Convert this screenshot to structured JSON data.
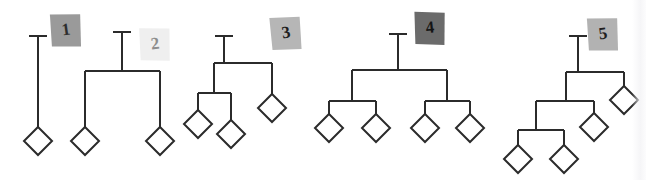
{
  "figure": {
    "background_color": "#ffffff",
    "line_color": "#2b2b2b",
    "leaf_fill": "#ffffff",
    "leaf_stroke": "#2b2b2b",
    "leaf_shape": "diamond",
    "width": 646,
    "height": 180
  },
  "badges": [
    {
      "label": "1",
      "fill": "#9a9a9a",
      "text_color": "#2e2e2e",
      "x": 66,
      "y": 30,
      "rotation": -8,
      "opacity": 1
    },
    {
      "label": "2",
      "fill": "#efefef",
      "text_color": "#8d8d8d",
      "x": 155,
      "y": 44,
      "rotation": -7,
      "opacity": 1
    },
    {
      "label": "3",
      "fill": "#b6b6b6",
      "text_color": "#1f1f1f",
      "x": 286,
      "y": 33,
      "rotation": -10,
      "opacity": 1
    },
    {
      "label": "4",
      "fill": "#6b6b6b",
      "text_color": "#141414",
      "x": 430,
      "y": 28,
      "rotation": -6,
      "opacity": 1
    },
    {
      "label": "5",
      "fill": "#b2b2b2",
      "text_color": "#1f1f1f",
      "x": 603,
      "y": 34,
      "rotation": -8,
      "opacity": 1
    }
  ],
  "trees": [
    {
      "id": "tree-1",
      "label": "1",
      "leaf_count": 1,
      "internal_node_count": 0,
      "max_depth": 1,
      "description": "Single unbranched stem ending in one tip",
      "stem": {
        "x": 38,
        "y_top": 36,
        "y_bottom": 127
      },
      "stem_cap": {
        "x1": 29,
        "x2": 47,
        "y": 36
      },
      "leaves": [
        {
          "cx": 38,
          "cy": 141
        }
      ],
      "connectors": []
    },
    {
      "id": "tree-2",
      "label": "2",
      "leaf_count": 2,
      "internal_node_count": 1,
      "max_depth": 2,
      "description": "Root splits into two tips",
      "stem": {
        "x": 122,
        "y_top": 32,
        "y_bottom": 71
      },
      "stem_cap": {
        "x1": 113,
        "x2": 131,
        "y": 32
      },
      "leaves": [
        {
          "cx": 85,
          "cy": 141
        },
        {
          "cx": 160,
          "cy": 141
        }
      ],
      "connectors": [
        {
          "type": "hbar",
          "x1": 85,
          "x2": 160,
          "y": 71
        },
        {
          "type": "vline",
          "x": 85,
          "y1": 71,
          "y2": 127
        },
        {
          "type": "vline",
          "x": 160,
          "y1": 71,
          "y2": 127
        }
      ]
    },
    {
      "id": "tree-3",
      "label": "3",
      "leaf_count": 3,
      "internal_node_count": 2,
      "max_depth": 3,
      "description": "Root splits into a two-tip clade on the left and a single tip on the right",
      "stem": {
        "x": 224,
        "y_top": 36,
        "y_bottom": 63
      },
      "stem_cap": {
        "x1": 215,
        "x2": 233,
        "y": 36
      },
      "leaves": [
        {
          "cx": 198,
          "cy": 124
        },
        {
          "cx": 231,
          "cy": 134
        },
        {
          "cx": 272,
          "cy": 108
        }
      ],
      "connectors": [
        {
          "type": "hbar",
          "x1": 214,
          "x2": 272,
          "y": 63
        },
        {
          "type": "vline",
          "x": 214,
          "y1": 63,
          "y2": 93
        },
        {
          "type": "vline",
          "x": 272,
          "y1": 63,
          "y2": 94
        },
        {
          "type": "hbar",
          "x1": 198,
          "x2": 231,
          "y": 93
        },
        {
          "type": "vline",
          "x": 198,
          "y1": 93,
          "y2": 110
        },
        {
          "type": "vline",
          "x": 231,
          "y1": 93,
          "y2": 120
        }
      ]
    },
    {
      "id": "tree-4",
      "label": "4",
      "leaf_count": 4,
      "internal_node_count": 3,
      "max_depth": 3,
      "description": "Balanced binary tree: root splits into two clades of two tips each",
      "stem": {
        "x": 398,
        "y_top": 34,
        "y_bottom": 70
      },
      "stem_cap": {
        "x1": 389,
        "x2": 407,
        "y": 34
      },
      "leaves": [
        {
          "cx": 329,
          "cy": 128
        },
        {
          "cx": 376,
          "cy": 128
        },
        {
          "cx": 425,
          "cy": 128
        },
        {
          "cx": 470,
          "cy": 128
        }
      ],
      "connectors": [
        {
          "type": "hbar",
          "x1": 352,
          "x2": 447,
          "y": 70
        },
        {
          "type": "vline",
          "x": 352,
          "y1": 70,
          "y2": 101
        },
        {
          "type": "vline",
          "x": 447,
          "y1": 70,
          "y2": 101
        },
        {
          "type": "hbar",
          "x1": 329,
          "x2": 376,
          "y": 101
        },
        {
          "type": "hbar",
          "x1": 425,
          "x2": 470,
          "y": 101
        },
        {
          "type": "vline",
          "x": 329,
          "y1": 101,
          "y2": 114
        },
        {
          "type": "vline",
          "x": 376,
          "y1": 101,
          "y2": 114
        },
        {
          "type": "vline",
          "x": 425,
          "y1": 101,
          "y2": 114
        },
        {
          "type": "vline",
          "x": 470,
          "y1": 101,
          "y2": 114
        }
      ]
    },
    {
      "id": "tree-5",
      "label": "5",
      "leaf_count": 4,
      "internal_node_count": 3,
      "max_depth": 4,
      "description": "Fully nested caterpillar tree: each split peels off one tip on the right",
      "stem": {
        "x": 578,
        "y_top": 36,
        "y_bottom": 72
      },
      "stem_cap": {
        "x1": 569,
        "x2": 587,
        "y": 36
      },
      "leaves": [
        {
          "cx": 518,
          "cy": 159
        },
        {
          "cx": 564,
          "cy": 159
        },
        {
          "cx": 594,
          "cy": 127
        },
        {
          "cx": 624,
          "cy": 100
        }
      ],
      "connectors": [
        {
          "type": "hbar",
          "x1": 566,
          "x2": 624,
          "y": 72
        },
        {
          "type": "vline",
          "x": 624,
          "y1": 72,
          "y2": 86
        },
        {
          "type": "vline",
          "x": 566,
          "y1": 72,
          "y2": 101
        },
        {
          "type": "hbar",
          "x1": 536,
          "x2": 594,
          "y": 101
        },
        {
          "type": "vline",
          "x": 594,
          "y1": 101,
          "y2": 113
        },
        {
          "type": "vline",
          "x": 536,
          "y1": 101,
          "y2": 130
        },
        {
          "type": "hbar",
          "x1": 518,
          "x2": 564,
          "y": 130
        },
        {
          "type": "vline",
          "x": 518,
          "y1": 130,
          "y2": 145
        },
        {
          "type": "vline",
          "x": 564,
          "y1": 130,
          "y2": 145
        }
      ]
    }
  ],
  "style": {
    "line_width": 2,
    "leaf_half_width": 14,
    "leaf_half_height": 14,
    "badge_width": 30,
    "badge_height": 34,
    "badge_font_size": 17
  }
}
